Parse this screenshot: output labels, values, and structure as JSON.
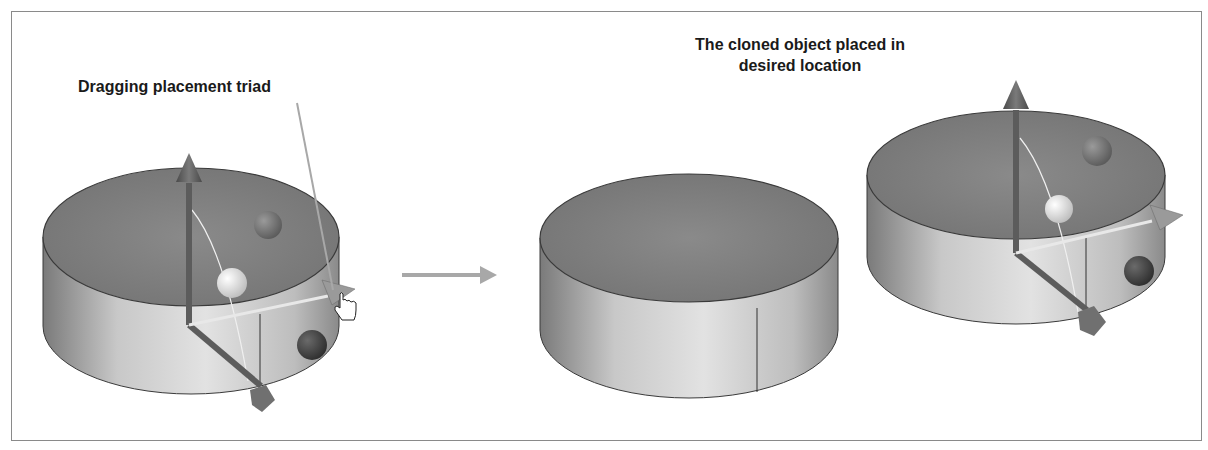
{
  "annotations": {
    "left_label": "Dragging placement triad",
    "right_label_line1": "The cloned object placed in",
    "right_label_line2": "desired location"
  },
  "scenes": [
    {
      "name": "original-cylinder-with-triad",
      "has_triad": true,
      "cursor": "hand-pointer"
    },
    {
      "name": "plain-cylinder",
      "has_triad": false
    },
    {
      "name": "cloned-cylinder-with-triad",
      "has_triad": true
    }
  ],
  "colors": {
    "cylinder_top": "#7e7e7e",
    "cylinder_side_light": "#d8d8d8",
    "cylinder_side_dark": "#8a8a8a",
    "triad_axis": "#5c5c5c",
    "arrow": "#a8a8a8",
    "frame_border": "#8a8a8a"
  }
}
